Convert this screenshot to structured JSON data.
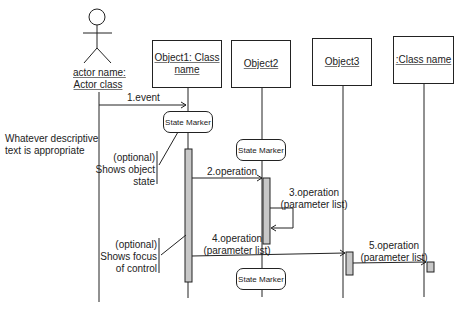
{
  "actor": {
    "name": "actor name:",
    "class": "Actor class"
  },
  "objects": [
    {
      "line1": "Object1: Class",
      "line2": "name"
    },
    {
      "line1": "Object2"
    },
    {
      "line1": "Object3"
    },
    {
      "line1": ":Class name"
    }
  ],
  "messages": [
    {
      "label": "1.event"
    },
    {
      "label": "2.operation"
    },
    {
      "line1": "3.operation",
      "line2": "(parameter list)"
    },
    {
      "line1": "4.operation",
      "line2": "(parameter list)"
    },
    {
      "line1": "5.operation",
      "line2": "(parameter list)"
    }
  ],
  "state_markers": [
    "State Marker",
    "State Marker",
    "State Marker"
  ],
  "notes": {
    "description": {
      "line1": "Whatever descriptive",
      "line2": "text is appropriate"
    },
    "object_state": {
      "line1": "(optional)",
      "line2": "Shows object",
      "line3": "state"
    },
    "focus_control": {
      "line1": "(optional)",
      "line2": "Shows focus",
      "line3": "of control"
    }
  },
  "colors": {
    "line": "#222222",
    "activation": "#c8c8c8"
  }
}
